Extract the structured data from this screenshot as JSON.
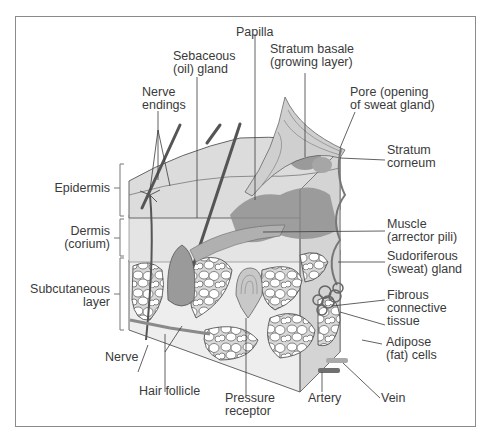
{
  "figure": {
    "colors": {
      "frame": "#8a8a8a",
      "label_text": "#3a3a3a",
      "leader_line": "#3a3a3a",
      "tissue_light": "#e6e6e6",
      "tissue_dark": "#8c8c8c"
    }
  },
  "labels": {
    "papilla": {
      "line1": "Papilla"
    },
    "sebaceous": {
      "line1": "Sebaceous",
      "line2": "(oil) gland"
    },
    "stratum_basale": {
      "line1": "Stratum basale",
      "line2": "(growing layer)"
    },
    "nerve_endings": {
      "line1": "Nerve",
      "line2": "endings"
    },
    "pore": {
      "line1": "Pore (opening",
      "line2": "of sweat gland)"
    },
    "stratum_corneum": {
      "line1": "Stratum",
      "line2": "corneum"
    },
    "epidermis": {
      "line1": "Epidermis"
    },
    "dermis": {
      "line1": "Dermis",
      "line2": "(corium)"
    },
    "subcutaneous": {
      "line1": "Subcutaneous",
      "line2": "layer"
    },
    "muscle": {
      "line1": "Muscle",
      "line2": "(arrector pili)"
    },
    "sudoriferous": {
      "line1": "Sudoriferous",
      "line2": "(sweat) gland"
    },
    "fibrous": {
      "line1": "Fibrous",
      "line2": "connective",
      "line3": "tissue"
    },
    "adipose": {
      "line1": "Adipose",
      "line2": "(fat) cells"
    },
    "nerve": {
      "line1": "Nerve"
    },
    "hair_follicle": {
      "line1": "Hair follicle"
    },
    "pressure_receptor": {
      "line1": "Pressure",
      "line2": "receptor"
    },
    "artery": {
      "line1": "Artery"
    },
    "vein": {
      "line1": "Vein"
    }
  }
}
